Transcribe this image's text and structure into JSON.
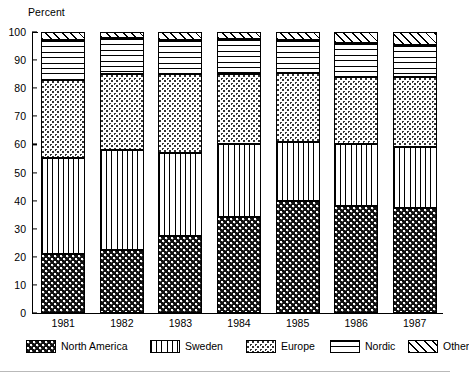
{
  "axis_title": "Percent",
  "y_ticks": [
    "100",
    "90",
    "80",
    "70",
    "60",
    "50",
    "40",
    "30",
    "20",
    "10",
    "0"
  ],
  "legend": {
    "items": [
      {
        "label": "North America",
        "pattern": "dense-checker-dark",
        "key": "north_america"
      },
      {
        "label": "Sweden",
        "pattern": "vertical-lines",
        "key": "sweden"
      },
      {
        "label": "Europe",
        "pattern": "light-stipple-dots",
        "key": "europe"
      },
      {
        "label": "Nordic",
        "pattern": "horizontal-lines",
        "key": "nordic"
      },
      {
        "label": "Other",
        "pattern": "diagonal-hatch",
        "key": "other"
      }
    ]
  },
  "chart_data": {
    "type": "bar",
    "subtype": "stacked-vertical-100-percent",
    "title": "",
    "subtitle": "",
    "xlabel": "",
    "ylabel": "Percent",
    "ylim": [
      0,
      100
    ],
    "y_tick_step": 10,
    "grid": false,
    "legend_position": "bottom",
    "categories": [
      "1981",
      "1982",
      "1983",
      "1984",
      "1985",
      "1986",
      "1987"
    ],
    "series": [
      {
        "name": "North America",
        "values": [
          21,
          22.5,
          27.5,
          34,
          40,
          38,
          37.5
        ]
      },
      {
        "name": "Sweden",
        "values": [
          34,
          35.5,
          29.5,
          26,
          21,
          22,
          21.5
        ]
      },
      {
        "name": "Europe",
        "values": [
          28,
          27,
          28,
          25,
          24.5,
          24,
          25
        ]
      },
      {
        "name": "Nordic",
        "values": [
          14,
          13,
          12,
          12.5,
          11.5,
          12,
          11.5
        ]
      },
      {
        "name": "Other",
        "values": [
          3,
          2,
          3,
          2.5,
          3,
          4,
          4.5
        ]
      }
    ],
    "cumulative_tops": {
      "1981": [
        21,
        55,
        83,
        97,
        100
      ],
      "1982": [
        22.5,
        58,
        85,
        98,
        100
      ],
      "1983": [
        27.5,
        57,
        85,
        97,
        100
      ],
      "1984": [
        34,
        60,
        85,
        97.5,
        100
      ],
      "1985": [
        40,
        61,
        85.5,
        97,
        100
      ],
      "1986": [
        38,
        60,
        84,
        96,
        100
      ],
      "1987": [
        37.5,
        59,
        84,
        95.5,
        100
      ]
    }
  }
}
